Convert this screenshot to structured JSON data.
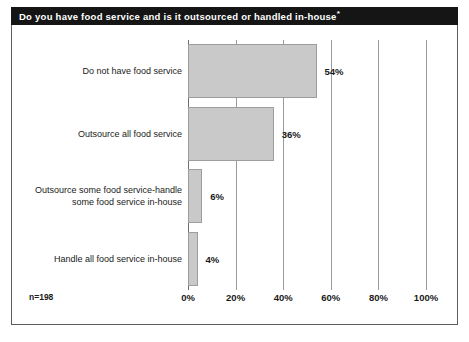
{
  "chart_data": {
    "type": "bar",
    "orientation": "horizontal",
    "title": "Do you have food service and is it outsourced or handled in-house",
    "title_suffix": "*",
    "categories": [
      "Do not have food service",
      "Outsource all food service",
      "Outsource some food service-handle\nsome food service in-house",
      "Handle all food service in-house"
    ],
    "values": [
      54,
      36,
      6,
      4
    ],
    "value_labels": [
      "54%",
      "36%",
      "6%",
      "4%"
    ],
    "xlabel": "",
    "ylabel": "",
    "xlim": [
      0,
      100
    ],
    "xticks": [
      0,
      20,
      40,
      60,
      80,
      100
    ],
    "xtick_labels": [
      "0%",
      "20%",
      "40%",
      "60%",
      "80%",
      "100%"
    ],
    "grid": true,
    "legend": false,
    "annotation": "n=198",
    "colors": {
      "bar_fill": "#c9c9c9",
      "bar_stroke": "#9d9d9d",
      "gridline": "#9a9a9a",
      "axis": "#6e6e6e",
      "title_bg": "#151515",
      "title_fg": "#ffffff",
      "text": "#1a1a1a",
      "frame": "#5d5d5d",
      "background": "#ffffff"
    }
  }
}
